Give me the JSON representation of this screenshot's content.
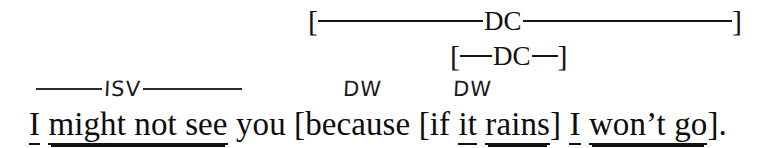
{
  "figure": {
    "kind": "sentence-clause-diagram",
    "background_color": "#ffffff",
    "ink_color": "#111111"
  },
  "spans": [
    {
      "id": "dc-outer",
      "label": "DC",
      "open_bracket": "[",
      "close_bracket": "]",
      "covers": "because [if it rains] I won't go"
    },
    {
      "id": "dc-inner",
      "label": "DC",
      "open_bracket": "[",
      "close_bracket": "]",
      "covers": "if it rains"
    }
  ],
  "annotations": {
    "isv": {
      "label": "ISV",
      "covers": "I might not see"
    },
    "dw": [
      {
        "label": "DW",
        "marks": "because"
      },
      {
        "label": "DW",
        "marks": "if"
      }
    ]
  },
  "sentence": {
    "full_text": "I might not see you [because [if it rains] I won't go].",
    "tokens": [
      {
        "text": "I",
        "underline": "single"
      },
      {
        "text": " ",
        "underline": "none"
      },
      {
        "text": "might not see",
        "underline": "double"
      },
      {
        "text": " you [because [if ",
        "underline": "none"
      },
      {
        "text": "it",
        "underline": "single"
      },
      {
        "text": " ",
        "underline": "none"
      },
      {
        "text": "rains",
        "underline": "double"
      },
      {
        "text": "] ",
        "underline": "none"
      },
      {
        "text": "I",
        "underline": "single"
      },
      {
        "text": " ",
        "underline": "none"
      },
      {
        "text": "won’t go",
        "underline": "double"
      },
      {
        "text": "].",
        "underline": "none"
      }
    ]
  },
  "legend": {
    "dc_meaning": "DC",
    "isv_meaning": "ISV",
    "dw_meaning": "DW"
  }
}
